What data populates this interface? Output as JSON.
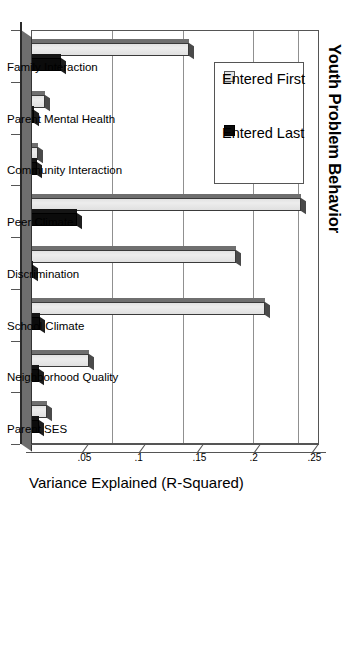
{
  "chart_data": {
    "type": "bar",
    "title": "Youth Problem Behavior",
    "xlabel": "",
    "ylabel": "Variance Explained (R-Squared)",
    "ylim": [
      0,
      0.25
    ],
    "yticks": [
      0.05,
      0.1,
      0.15,
      0.2,
      0.25
    ],
    "ytick_labels": [
      ".05",
      ".1",
      ".15",
      ".2",
      ".25"
    ],
    "grid": true,
    "legend_position": "top-left",
    "orientation": "vertical-bars-rotated-90",
    "categories": [
      "Family Interaction",
      "Parent Mental Health",
      "Community Interaction",
      "Peer Climate",
      "Discrimination",
      "School Climate",
      "Neighborhood Quality",
      "Parent SES"
    ],
    "series": [
      {
        "name": "Entered First",
        "color": "#e6e6e6",
        "values": [
          0.137,
          0.012,
          0.006,
          0.234,
          0.178,
          0.203,
          0.05,
          0.014
        ]
      },
      {
        "name": "Entered Last",
        "color": "#0b0b0b",
        "values": [
          0.026,
          0.003,
          0.005,
          0.04,
          0.002,
          0.008,
          0.007,
          0.007
        ]
      }
    ]
  },
  "legend": {
    "entries": [
      {
        "label": "Entered First"
      },
      {
        "label": "Entered Last"
      }
    ]
  }
}
